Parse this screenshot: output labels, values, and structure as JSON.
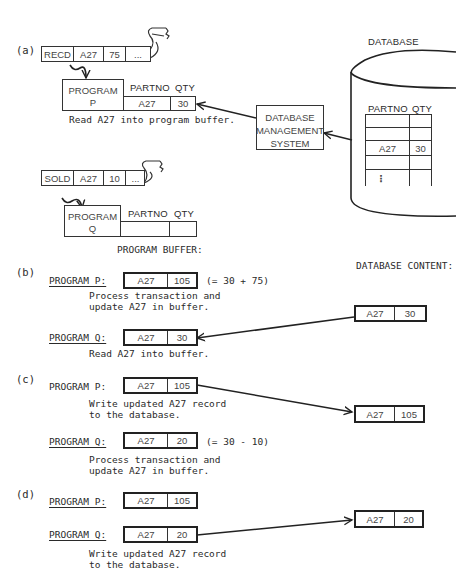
{
  "panel_a": {
    "label": "(a)",
    "tape_p": {
      "cells": [
        "RECD",
        "A27",
        "75",
        "..."
      ]
    },
    "program_p": {
      "name_line1": "PROGRAM",
      "name_line2": "P",
      "col_partno": "PARTNO",
      "col_qty": "QTY",
      "partno": "A27",
      "qty": "30",
      "caption": "Read A27 into program buffer."
    },
    "tape_q": {
      "cells": [
        "SOLD",
        "A27",
        "10",
        "..."
      ]
    },
    "program_q": {
      "name_line1": "PROGRAM",
      "name_line2": "Q",
      "col_partno": "PARTNO",
      "col_qty": "QTY",
      "partno": "",
      "qty": ""
    },
    "dbms": {
      "line1": "DATABASE",
      "line2": "MANAGEMENT",
      "line3": "SYSTEM"
    },
    "database": {
      "label": "DATABASE",
      "col_partno": "PARTNO",
      "col_qty": "QTY",
      "rows": [
        [
          "",
          ""
        ],
        [
          "",
          ""
        ],
        [
          "A27",
          "30"
        ],
        [
          "",
          ""
        ],
        [
          "⋮",
          ""
        ]
      ]
    }
  },
  "headers": {
    "program_buffer": "PROGRAM BUFFER:",
    "database_content": "DATABASE CONTENT:"
  },
  "panel_b": {
    "label": "(b)",
    "p_label": "PROGRAM P:",
    "p_partno": "A27",
    "p_qty": "105",
    "p_note": "(= 30 + 75)",
    "p_caption_1": "Process transaction and",
    "p_caption_2": "update A27 in buffer.",
    "q_label": "PROGRAM Q:",
    "q_partno": "A27",
    "q_qty": "30",
    "q_caption": "Read A27 into buffer.",
    "db_partno": "A27",
    "db_qty": "30"
  },
  "panel_c": {
    "label": "(c)",
    "p_label": "PROGRAM P:",
    "p_partno": "A27",
    "p_qty": "105",
    "p_caption_1": "Write updated A27 record",
    "p_caption_2": "to the database.",
    "q_label": "PROGRAM Q:",
    "q_partno": "A27",
    "q_qty": "20",
    "q_note": "(= 30 - 10)",
    "q_caption_1": "Process transaction and",
    "q_caption_2": "update A27 in buffer.",
    "db_partno": "A27",
    "db_qty": "105"
  },
  "panel_d": {
    "label": "(d)",
    "p_label": "PROGRAM P:",
    "p_partno": "A27",
    "p_qty": "105",
    "q_label": "PROGRAM Q:",
    "q_partno": "A27",
    "q_qty": "20",
    "q_caption_1": "Write updated A27 record",
    "q_caption_2": "to the database.",
    "db_partno": "A27",
    "db_qty": "20"
  }
}
